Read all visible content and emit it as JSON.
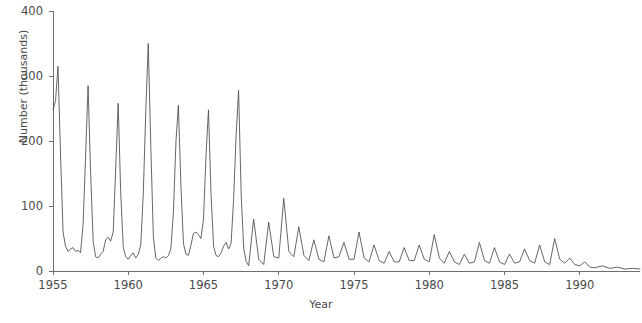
{
  "chart_data": {
    "type": "line",
    "title": "",
    "xlabel": "Year",
    "ylabel": "Number (thousands)",
    "xlim": [
      1955,
      1994
    ],
    "ylim": [
      0,
      400
    ],
    "grid": false,
    "legend": "none",
    "yticks": [
      0,
      100,
      200,
      300,
      400
    ],
    "ytick_labels": [
      "0",
      "100",
      "200",
      "300",
      "400"
    ],
    "xticks": [
      1955,
      1960,
      1965,
      1970,
      1975,
      1980,
      1985,
      1990
    ],
    "xtick_labels": [
      "1955",
      "1960",
      "1965",
      "1970",
      "1975",
      "1980",
      "1985",
      "1990"
    ],
    "series": [
      {
        "name": "Reported cases",
        "color": "#4a4a4a",
        "x": [
          1955.0,
          1955.17,
          1955.33,
          1955.5,
          1955.67,
          1955.83,
          1956.0,
          1956.17,
          1956.33,
          1956.5,
          1956.67,
          1956.83,
          1957.0,
          1957.17,
          1957.33,
          1957.5,
          1957.67,
          1957.83,
          1958.0,
          1958.17,
          1958.33,
          1958.5,
          1958.67,
          1958.83,
          1959.0,
          1959.17,
          1959.33,
          1959.5,
          1959.67,
          1959.83,
          1960.0,
          1960.17,
          1960.33,
          1960.5,
          1960.67,
          1960.83,
          1961.0,
          1961.17,
          1961.33,
          1961.5,
          1961.67,
          1961.83,
          1962.0,
          1962.17,
          1962.33,
          1962.5,
          1962.67,
          1962.83,
          1963.0,
          1963.17,
          1963.33,
          1963.5,
          1963.67,
          1963.83,
          1964.0,
          1964.17,
          1964.33,
          1964.5,
          1964.67,
          1964.83,
          1965.0,
          1965.17,
          1965.33,
          1965.5,
          1965.67,
          1965.83,
          1966.0,
          1966.17,
          1966.33,
          1966.5,
          1966.67,
          1966.83,
          1967.0,
          1967.17,
          1967.33,
          1967.5,
          1967.67,
          1967.83,
          1968.0,
          1968.33,
          1968.67,
          1969.0,
          1969.33,
          1969.67,
          1970.0,
          1970.33,
          1970.67,
          1971.0,
          1971.33,
          1971.67,
          1972.0,
          1972.33,
          1972.67,
          1973.0,
          1973.33,
          1973.67,
          1974.0,
          1974.33,
          1974.67,
          1975.0,
          1975.33,
          1975.67,
          1976.0,
          1976.33,
          1976.67,
          1977.0,
          1977.33,
          1977.67,
          1978.0,
          1978.33,
          1978.67,
          1979.0,
          1979.33,
          1979.67,
          1980.0,
          1980.33,
          1980.67,
          1981.0,
          1981.33,
          1981.67,
          1982.0,
          1982.33,
          1982.67,
          1983.0,
          1983.33,
          1983.67,
          1984.0,
          1984.33,
          1984.67,
          1985.0,
          1985.33,
          1985.67,
          1986.0,
          1986.33,
          1986.67,
          1987.0,
          1987.33,
          1987.67,
          1988.0,
          1988.33,
          1988.67,
          1989.0,
          1989.33,
          1989.67,
          1990.0,
          1990.33,
          1990.67,
          1991.0,
          1991.5,
          1992.0,
          1992.5,
          1993.0,
          1993.5,
          1994.0
        ],
        "values": [
          248,
          262,
          315,
          180,
          60,
          38,
          30,
          34,
          36,
          30,
          32,
          28,
          72,
          180,
          285,
          150,
          45,
          22,
          20,
          26,
          30,
          48,
          52,
          46,
          60,
          160,
          258,
          120,
          36,
          22,
          18,
          24,
          28,
          20,
          26,
          40,
          120,
          250,
          350,
          190,
          52,
          20,
          16,
          20,
          22,
          20,
          24,
          34,
          90,
          200,
          255,
          130,
          42,
          26,
          24,
          40,
          58,
          60,
          56,
          50,
          80,
          180,
          248,
          118,
          38,
          24,
          22,
          28,
          38,
          44,
          34,
          42,
          110,
          210,
          278,
          120,
          35,
          15,
          8,
          80,
          18,
          10,
          75,
          22,
          20,
          112,
          30,
          22,
          68,
          24,
          16,
          48,
          18,
          14,
          54,
          20,
          22,
          44,
          18,
          18,
          60,
          20,
          14,
          40,
          16,
          12,
          30,
          14,
          14,
          36,
          16,
          16,
          40,
          18,
          14,
          56,
          20,
          12,
          30,
          14,
          10,
          26,
          12,
          14,
          44,
          16,
          12,
          36,
          14,
          10,
          26,
          12,
          14,
          34,
          16,
          12,
          40,
          14,
          10,
          50,
          18,
          12,
          20,
          10,
          8,
          14,
          6,
          5,
          8,
          4,
          6,
          3,
          4,
          3
        ]
      }
    ]
  },
  "axis": {
    "y_title": "Number (thousands)",
    "x_title": "Year"
  }
}
